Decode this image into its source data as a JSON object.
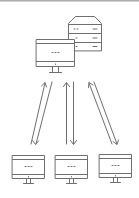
{
  "diagram": {
    "title": "",
    "stroke_color": "#6f6f6f",
    "background": "#ffffff",
    "nodes": [
      {
        "id": "server",
        "type": "server-rack",
        "drawers": 3
      },
      {
        "id": "main-workstation",
        "type": "desktop-monitor"
      },
      {
        "id": "client-1",
        "type": "desktop-monitor"
      },
      {
        "id": "client-2",
        "type": "desktop-monitor"
      },
      {
        "id": "client-3",
        "type": "desktop-monitor"
      }
    ],
    "edges": [
      {
        "from": "client-1",
        "to": "main-workstation",
        "direction": "bidirectional"
      },
      {
        "from": "client-2",
        "to": "main-workstation",
        "direction": "bidirectional"
      },
      {
        "from": "client-3",
        "to": "server",
        "direction": "bidirectional"
      }
    ]
  }
}
